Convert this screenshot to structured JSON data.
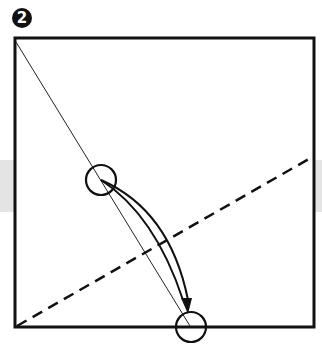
{
  "step": {
    "number": "2"
  },
  "diagram": {
    "square": {
      "x": 15,
      "y": 38,
      "size_w": 299,
      "size_h": 289
    },
    "band": {
      "y": 160,
      "height": 52,
      "color": "#e4e4e4"
    },
    "crease_line": {
      "from": [
        15,
        42
      ],
      "to": [
        190,
        327
      ],
      "style": "thin"
    },
    "fold_line": {
      "from": [
        15,
        327
      ],
      "to": [
        314,
        156
      ],
      "style": "dashed"
    },
    "reference_points": [
      {
        "name": "start-point",
        "center": [
          101,
          180
        ],
        "radius": 15
      },
      {
        "name": "target-point",
        "center": [
          191,
          327
        ],
        "radius": 15
      }
    ],
    "fold_arrow": {
      "from": [
        101,
        180
      ],
      "to": [
        188,
        305
      ]
    },
    "colors": {
      "line": "#111111",
      "background": "#ffffff"
    }
  }
}
